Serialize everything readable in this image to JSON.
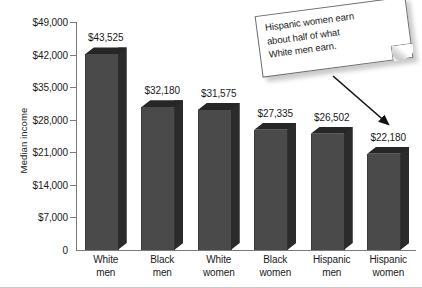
{
  "chart_data": {
    "type": "bar",
    "title": "",
    "subtitle": "",
    "xlabel": "",
    "ylabel": "Median income",
    "categories": [
      "White men",
      "Black men",
      "White women",
      "Black women",
      "Hispanic men",
      "Hispanic women"
    ],
    "category_lines": [
      [
        "White",
        "men"
      ],
      [
        "Black",
        "men"
      ],
      [
        "White",
        "women"
      ],
      [
        "Black",
        "women"
      ],
      [
        "Hispanic",
        "men"
      ],
      [
        "Hispanic",
        "women"
      ]
    ],
    "values": [
      43525,
      32180,
      31575,
      27335,
      26502,
      22180
    ],
    "value_labels": [
      "$43,525",
      "$32,180",
      "$31,575",
      "$27,335",
      "$26,502",
      "$22,180"
    ],
    "ylim": [
      0,
      49000
    ],
    "ytick_values": [
      49000,
      42000,
      35000,
      28000,
      21000,
      14000,
      7000,
      0
    ],
    "ytick_labels": [
      "$49,000",
      "$42,000",
      "$35,000",
      "$28,000",
      "$21,000",
      "$14,000",
      "$7,000",
      "0"
    ],
    "grid": false,
    "legend": null,
    "bar_style": "3d",
    "colors": {
      "bar_front": "#4a4a4a",
      "bar_side": "#2b2b2b",
      "bar_top": "#262626",
      "axis": "#7a7a7a",
      "text": "#1a1a1a",
      "background": "#ffffff"
    },
    "annotations": [
      {
        "name": "callout-note",
        "lines": [
          "Hispanic women earn",
          "about half of what",
          "White men earn."
        ],
        "text": "Hispanic women earn about half of what White men earn.",
        "points_to": "Hispanic women"
      }
    ]
  }
}
